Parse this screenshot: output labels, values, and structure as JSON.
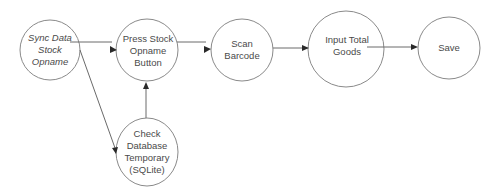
{
  "diagram": {
    "type": "flowchart",
    "colors": {
      "background": "#ffffff",
      "node_stroke": "#8a8a8a",
      "edge_stroke": "#6a6a6a",
      "arrowhead": "#2a2a2a",
      "text": "#4a4a4a"
    },
    "nodes": [
      {
        "id": "sync",
        "label": "Sync Data\nStock\nOpname",
        "italic": true,
        "cx": 50,
        "cy": 50,
        "r": 30
      },
      {
        "id": "press",
        "label": "Press Stock\nOpname\nButton",
        "italic": false,
        "cx": 147,
        "cy": 50,
        "r": 31
      },
      {
        "id": "scan",
        "label": "Scan\nBarcode",
        "italic": false,
        "cx": 242,
        "cy": 50,
        "r": 31
      },
      {
        "id": "input",
        "label": "Input Total\nGoods",
        "italic": false,
        "cx": 346,
        "cy": 49,
        "r": 38
      },
      {
        "id": "save",
        "label": "Save",
        "italic": false,
        "cx": 449,
        "cy": 48,
        "r": 31
      },
      {
        "id": "check",
        "label": "Check\nDatabase\nTemporary\n(SQLite)",
        "italic": false,
        "cx": 147,
        "cy": 152,
        "r": 32
      }
    ],
    "edges": [
      {
        "from": "sync",
        "to": "press"
      },
      {
        "from": "sync",
        "to": "check"
      },
      {
        "from": "check",
        "to": "press"
      },
      {
        "from": "press",
        "to": "scan"
      },
      {
        "from": "scan",
        "to": "input"
      },
      {
        "from": "input",
        "to": "save"
      }
    ],
    "labels": {
      "sync": "Sync Data\nStock\nOpname",
      "press": "Press Stock\nOpname\nButton",
      "scan": "Scan\nBarcode",
      "input": "Input Total\nGoods",
      "save": "Save",
      "check": "Check\nDatabase\nTemporary\n(SQLite)"
    }
  }
}
